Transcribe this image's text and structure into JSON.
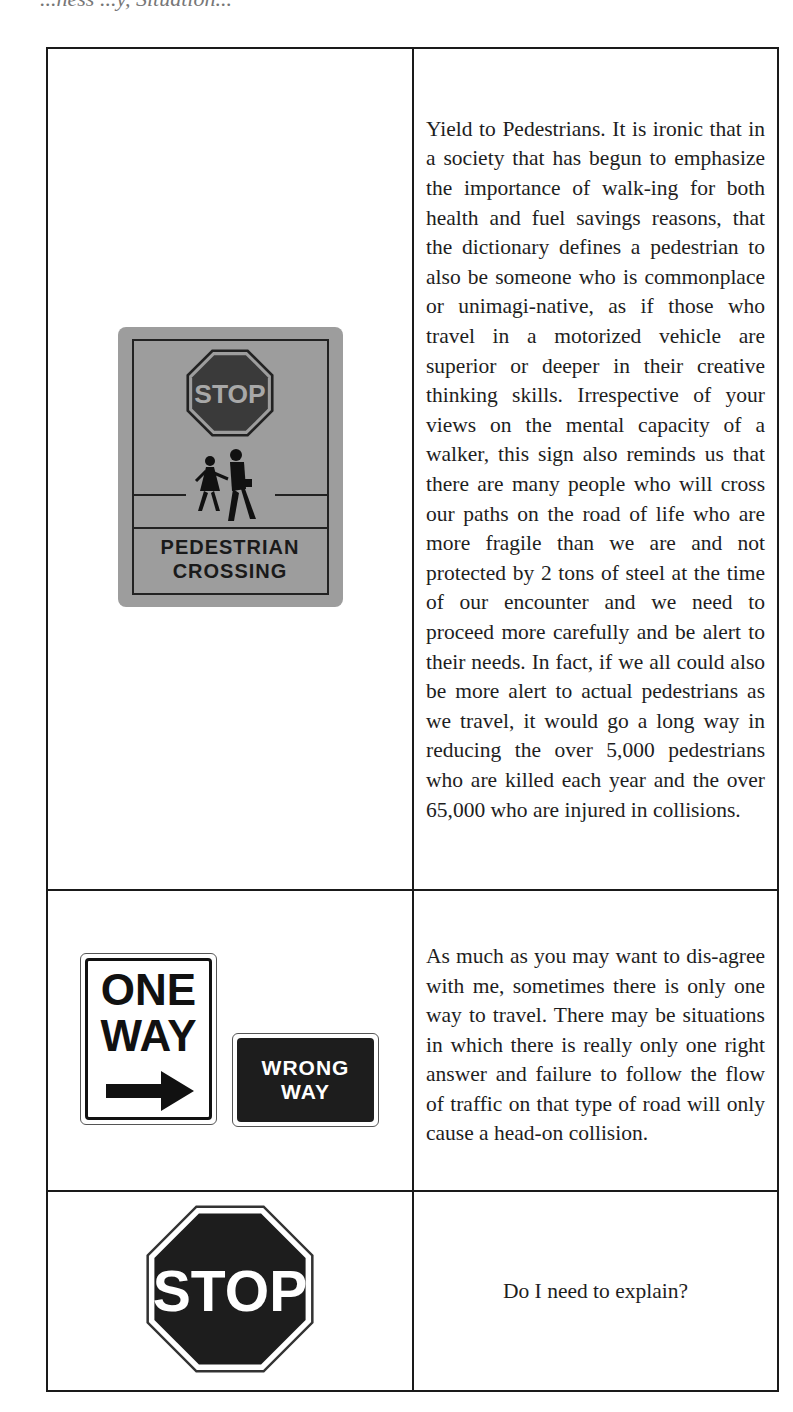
{
  "header": {
    "cutoff_text": "...ness ...y, Situation..."
  },
  "rows": [
    {
      "sign": {
        "type": "pedestrian-crossing",
        "stop_label": "STOP",
        "label_line1": "PEDESTRIAN",
        "label_line2": "CROSSING"
      },
      "text": "Yield to Pedestrians.  It is ironic that in a society that has begun to emphasize the importance of walk-ing for both health and fuel savings reasons, that the dictionary defines a pedestrian to also be someone who is commonplace or unimagi-native, as if those who travel in a motorized vehicle are superior or deeper in their creative thinking skills.  Irrespective of your views on the mental capacity of a walker, this sign also reminds us that there are many people who will cross our paths on the road of life who are more fragile than we are and not protected by 2 tons of steel at the time of our encounter and we need to proceed more carefully and be alert to their needs.  In fact, if we all could also be more alert to actual pedestrians as we travel, it would go a long way in reducing the over 5,000 pedestrians who are killed each year and the over 65,000 who are injured in collisions."
    },
    {
      "sign": {
        "type": "one-way-and-wrong-way",
        "one_way_line1": "ONE",
        "one_way_line2": "WAY",
        "wrong_way_line1": "WRONG",
        "wrong_way_line2": "WAY"
      },
      "text": "As much as you may want to dis-agree with me, sometimes there is only one way to travel.  There may be situations in which there is really only one right answer and failure to follow the flow of traffic on that type of road will only cause a head-on collision."
    },
    {
      "sign": {
        "type": "stop",
        "label": "STOP"
      },
      "text": "Do I need to explain?"
    }
  ],
  "colors": {
    "border": "#1a1a1a",
    "text": "#1e1e1e",
    "ped_sign_bg": "#9d9d9d",
    "sign_dark": "#1d1d1d"
  }
}
